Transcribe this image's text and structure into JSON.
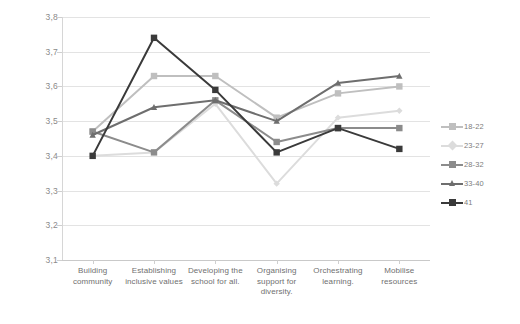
{
  "chart_data": {
    "type": "line",
    "title": "",
    "xlabel": "",
    "ylabel": "",
    "ylim": [
      3.1,
      3.8
    ],
    "ytick_step": 0.1,
    "decimal_separator": ",",
    "grid": true,
    "legend_position": "right",
    "categories": [
      "Building community",
      "Establishing inclusive values",
      "Developing the school for all.",
      "Organising support for diversity.",
      "Orchestrating learning.",
      "Mobilise resources"
    ],
    "category_lines": [
      [
        "Building",
        "community"
      ],
      [
        "Establishing",
        "inclusive values"
      ],
      [
        "Developing the",
        "school for all."
      ],
      [
        "Organising",
        "support for",
        "diversity."
      ],
      [
        "Orchestrating",
        "learning."
      ],
      [
        "Mobilise",
        "resources"
      ]
    ],
    "yticks": [
      "3,8",
      "3,7",
      "3,6",
      "3,5",
      "3,4",
      "3,3",
      "3,2",
      "3,1"
    ],
    "ytick_values": [
      3.8,
      3.7,
      3.6,
      3.5,
      3.4,
      3.3,
      3.2,
      3.1
    ],
    "series": [
      {
        "name": "18-22",
        "color": "#bfbfbf",
        "marker": "square",
        "values": [
          3.47,
          3.63,
          3.63,
          3.51,
          3.58,
          3.6
        ]
      },
      {
        "name": "23-27",
        "color": "#dcdcdc",
        "marker": "diamond",
        "values": [
          3.4,
          3.41,
          3.55,
          3.32,
          3.51,
          3.53
        ]
      },
      {
        "name": "28-32",
        "color": "#8c8c8c",
        "marker": "square",
        "values": [
          3.47,
          3.41,
          3.56,
          3.44,
          3.48,
          3.48
        ]
      },
      {
        "name": "33-40",
        "color": "#6e6e6e",
        "marker": "triangle",
        "values": [
          3.46,
          3.54,
          3.56,
          3.5,
          3.61,
          3.63
        ]
      },
      {
        "name": "41",
        "color": "#3a3a3a",
        "marker": "square",
        "values": [
          3.4,
          3.74,
          3.59,
          3.41,
          3.48,
          3.42
        ]
      }
    ]
  }
}
